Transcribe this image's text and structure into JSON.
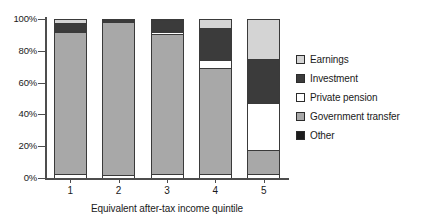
{
  "chart_data": {
    "type": "bar",
    "title": "",
    "xlabel": "Equivalent after-tax income quintile",
    "ylabel": "",
    "categories": [
      "1",
      "2",
      "3",
      "4",
      "5"
    ],
    "ytick_labels": [
      "0%",
      "20%",
      "40%",
      "60%",
      "80%",
      "100%"
    ],
    "ytick_values": [
      0,
      20,
      40,
      60,
      80,
      100
    ],
    "ylim": [
      0,
      100
    ],
    "grid": false,
    "stacked": true,
    "legend_position": "right",
    "series": [
      {
        "name": "Earnings",
        "color": "#d4d4d4",
        "values": [
          3,
          1,
          1,
          6,
          26
        ]
      },
      {
        "name": "Investment",
        "color": "#3b3b3b",
        "values": [
          6,
          2,
          8,
          21,
          28
        ]
      },
      {
        "name": "Private pension",
        "color": "#ffffff",
        "values": [
          1,
          0,
          2,
          6,
          30
        ]
      },
      {
        "name": "Government transfer",
        "color": "#a8a8a8",
        "values": [
          90,
          97,
          89,
          67,
          16
        ]
      },
      {
        "name": "Other",
        "color": "#1c1c1c",
        "values": [
          0,
          0,
          0,
          0,
          0
        ]
      }
    ]
  },
  "legend": {
    "items": [
      {
        "label": "Earnings",
        "swatch": "#d4d4d4"
      },
      {
        "label": "Investment",
        "swatch": "#3b3b3b"
      },
      {
        "label": "Private pension",
        "swatch": "#ffffff"
      },
      {
        "label": "Government transfer",
        "swatch": "#a8a8a8"
      },
      {
        "label": "Other",
        "swatch": "#1c1c1c"
      }
    ]
  }
}
